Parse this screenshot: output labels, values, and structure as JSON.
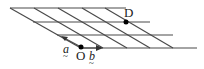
{
  "diagram": {
    "type": "oblique-grid",
    "points": {
      "O": {
        "label": "O",
        "x": 81,
        "y": 47
      },
      "D": {
        "label": "D",
        "x": 126,
        "y": 22
      }
    },
    "vectors": {
      "a": {
        "label": "a",
        "underline": "~"
      },
      "b": {
        "label": "b",
        "underline": "~"
      }
    },
    "colors": {
      "line": "#4a4a4a",
      "point": "#000000",
      "background": "#ffffff"
    }
  }
}
